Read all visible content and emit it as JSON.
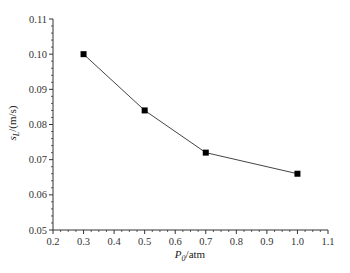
{
  "chart_data": {
    "type": "line",
    "title": "",
    "xlabel": "P0/atm",
    "xlabel_main": "P",
    "xlabel_sub": "0",
    "xlabel_unit": "/atm",
    "ylabel": "sL/(m/s)",
    "ylabel_main": "s",
    "ylabel_sub": "L",
    "ylabel_unit": "/(m/s)",
    "xlim": [
      0.2,
      1.1
    ],
    "ylim": [
      0.05,
      0.11
    ],
    "x_ticks": [
      "0.2",
      "0.3",
      "0.4",
      "0.5",
      "0.6",
      "0.7",
      "0.8",
      "0.9",
      "1.0",
      "1.1"
    ],
    "y_ticks": [
      "0.05",
      "0.06",
      "0.07",
      "0.08",
      "0.09",
      "0.10",
      "0.11"
    ],
    "grid": false,
    "legend": null,
    "series": [
      {
        "name": "sL",
        "marker": "square",
        "color": "#000000",
        "x": [
          0.3,
          0.5,
          0.7,
          1.0
        ],
        "values": [
          0.1,
          0.084,
          0.072,
          0.066
        ]
      }
    ]
  },
  "caption_partial": "（caption text cut off at bottom of image）"
}
